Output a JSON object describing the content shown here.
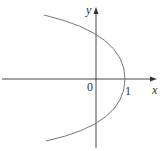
{
  "figure": {
    "type": "parabola graph",
    "equation": "x = 1 - y^2",
    "labels": {
      "x_axis": "x",
      "y_axis": "y",
      "origin": "0",
      "x_intercept": "1"
    },
    "colors": {
      "axis": "#333333",
      "curve": "#777777"
    }
  }
}
